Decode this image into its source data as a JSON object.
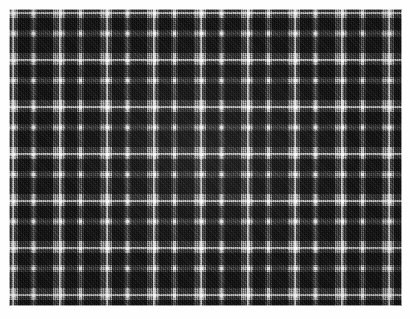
{
  "image": {
    "subject": "Grayscale tartan plaid fabric swatch",
    "medium": "Woven cloth, close-up photograph",
    "width_px": 410,
    "height_px": 319,
    "orientation": "landscape"
  },
  "border": {
    "name": "white mat border",
    "color": "#fefefe",
    "thickness_px": 9
  },
  "swatch": {
    "name": "plaid fabric area",
    "left_px": 9,
    "top_px": 9,
    "width_px": 393,
    "height_px": 297
  },
  "pattern": {
    "type": "tartan-plaid",
    "weave": "twill",
    "sett_repeat_px": 47,
    "symmetry": "symmetrical / balanced sett",
    "repeats_horizontal": 8.4,
    "repeats_vertical": 6.3,
    "description": "Even-check grayscale tartan: large dark charcoal squares separated by medium gray bands, overlaid with narrow bright white tramlines crossing in both directions."
  },
  "colors": {
    "dark_block": "#3a3a3a",
    "mid_gray": "#6e6e6e",
    "light_gray": "#a8a8a8",
    "white_line": "#f4f4f4",
    "mat": "#fefefe",
    "background": "#ffffff"
  },
  "stripe_sequence": [
    {
      "name": "light guard",
      "color": "#a8a8a8",
      "width_px": 3
    },
    {
      "name": "white accent",
      "color": "#f6f6f6",
      "width_px": 3
    },
    {
      "name": "light guard",
      "color": "#a8a8a8",
      "width_px": 3
    },
    {
      "name": "dark block",
      "color": "#3a3a3a",
      "width_px": 12
    },
    {
      "name": "mid gray",
      "color": "#808080",
      "width_px": 2
    },
    {
      "name": "white tramline",
      "color": "#eeeeee",
      "width_px": 3
    },
    {
      "name": "mid gray",
      "color": "#808080",
      "width_px": 2
    },
    {
      "name": "dark block",
      "color": "#3a3a3a",
      "width_px": 16
    },
    {
      "name": "light guard",
      "color": "#a8a8a8",
      "width_px": 3
    }
  ],
  "caption": "Close-up of a gray and white tartan plaid woven fabric swatch on a white background."
}
